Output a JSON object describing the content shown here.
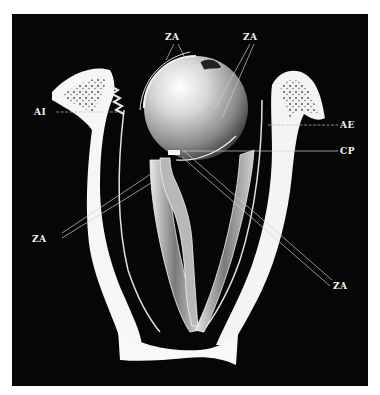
{
  "figure": {
    "background_color": "#000000",
    "paper_color": "#ffffff",
    "labels": {
      "za_top_left": "ZA",
      "za_top_right": "ZA",
      "ai": "AI",
      "ae": "AE",
      "cp": "CP",
      "za_left": "ZA",
      "za_bottom_right": "ZA"
    }
  }
}
